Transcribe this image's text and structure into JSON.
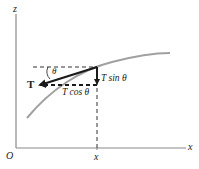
{
  "figure": {
    "axes": {
      "origin_label": "O",
      "x_axis_label": "x",
      "z_axis_label": "z",
      "x_tick_label": "x"
    },
    "vectors": {
      "tension_label": "T",
      "vertical_component_label": "T sin θ",
      "horizontal_component_label": "T cos θ",
      "angle_label": "θ"
    },
    "colors": {
      "axis": "#8a8a8a",
      "curve": "#a0a0a0",
      "vector": "#1a1a1a",
      "dashed": "#333333"
    }
  }
}
